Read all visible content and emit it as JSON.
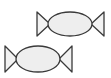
{
  "canvas": {
    "width": 111,
    "height": 78,
    "background_color": "#ffffff"
  },
  "style": {
    "outline_color": "#3a3a3a",
    "ellipse_fill": "#eeeeee",
    "triangle_fill": "#f2f2f2",
    "stroke_width": 1.3
  },
  "diagram": {
    "shape_count": 2,
    "shapes": [
      {
        "id": "bowtie-top",
        "label": "Bowtie valve symbol (upper right)",
        "ellipse": {
          "cx": 70,
          "cy": 24,
          "rx": 22,
          "ry": 12
        },
        "left_triangle": {
          "points": "37,12 37,36 50,24",
          "label": "left triangle pointing right"
        },
        "right_triangle": {
          "points": "104,12 104,36 91,24",
          "label": "right triangle pointing left"
        }
      },
      {
        "id": "bowtie-bottom",
        "label": "Bowtie valve symbol (lower left)",
        "ellipse": {
          "cx": 38,
          "cy": 59,
          "rx": 22,
          "ry": 13
        },
        "left_triangle": {
          "points": "5,46 5,72 18,59",
          "label": "left triangle pointing right"
        },
        "right_triangle": {
          "points": "72,46 72,72 59,59",
          "label": "right triangle pointing left"
        }
      }
    ]
  }
}
